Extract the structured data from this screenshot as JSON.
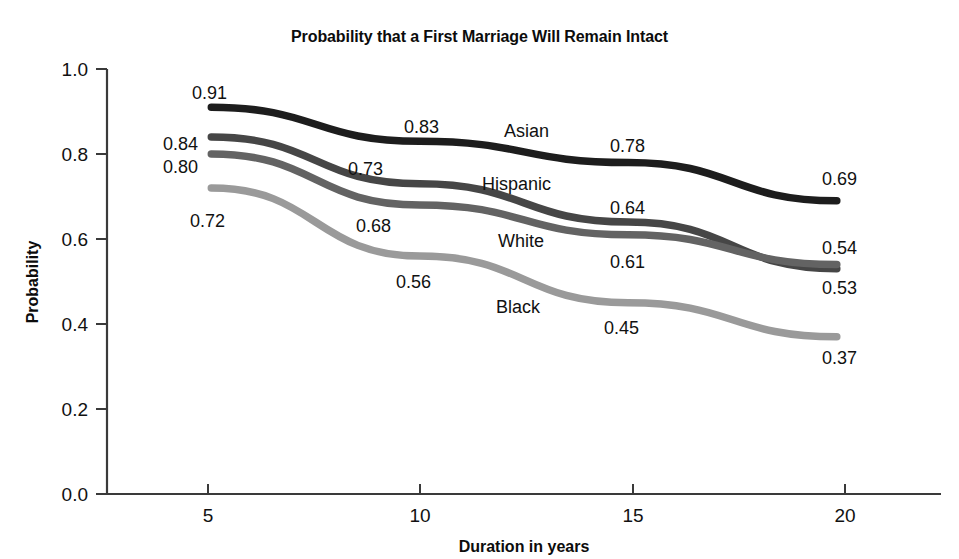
{
  "chart_data": {
    "type": "line",
    "title": "Probability that a First Marriage Will Remain Intact",
    "xlabel": "Duration in years",
    "ylabel": "Probability",
    "x": [
      5,
      10,
      15,
      20
    ],
    "xticks": [
      "5",
      "10",
      "15",
      "20"
    ],
    "yticks": [
      "0.0",
      "0.2",
      "0.4",
      "0.6",
      "0.8",
      "1.0"
    ],
    "xlim": [
      2.5,
      22.5
    ],
    "ylim": [
      0.0,
      1.0
    ],
    "grid": false,
    "legend_position": "inline-labels",
    "series": [
      {
        "name": "Asian",
        "color": "#1d1d1d",
        "values": [
          0.91,
          0.83,
          0.78,
          0.69
        ],
        "labels": [
          "0.91",
          "0.83",
          "0.78",
          "0.69"
        ]
      },
      {
        "name": "Hispanic",
        "color": "#464646",
        "values": [
          0.84,
          0.73,
          0.64,
          0.53
        ],
        "labels": [
          "0.84",
          "0.73",
          "0.64",
          "0.53"
        ]
      },
      {
        "name": "White",
        "color": "#636363",
        "values": [
          0.8,
          0.68,
          0.61,
          0.54
        ],
        "labels": [
          "0.80",
          "0.68",
          "0.61",
          "0.54"
        ]
      },
      {
        "name": "Black",
        "color": "#9a9a9a",
        "values": [
          0.72,
          0.56,
          0.45,
          0.37
        ],
        "labels": [
          "0.72",
          "0.56",
          "0.45",
          "0.37"
        ]
      }
    ]
  },
  "axis": {
    "y_tick_1": "1.0",
    "y_tick_2": "0.8",
    "y_tick_3": "0.6",
    "y_tick_4": "0.4",
    "y_tick_5": "0.2",
    "y_tick_6": "0.0",
    "x_tick_1": "5",
    "x_tick_2": "10",
    "x_tick_3": "15",
    "x_tick_4": "20",
    "y_title": "Probability",
    "x_title": "Duration in years"
  },
  "point_labels": {
    "asian_5": "0.91",
    "asian_10": "0.83",
    "asian_15": "0.78",
    "asian_20": "0.69",
    "hispanic_5": "0.84",
    "hispanic_10": "0.73",
    "hispanic_15": "0.64",
    "hispanic_20": "0.53",
    "white_5": "0.80",
    "white_10": "0.68",
    "white_15": "0.61",
    "white_20": "0.54",
    "black_5": "0.72",
    "black_10": "0.56",
    "black_15": "0.45",
    "black_20": "0.37"
  },
  "series_names": {
    "asian": "Asian",
    "hispanic": "Hispanic",
    "white": "White",
    "black": "Black"
  },
  "title": {
    "text": "Probability that a First Marriage Will Remain Intact"
  }
}
